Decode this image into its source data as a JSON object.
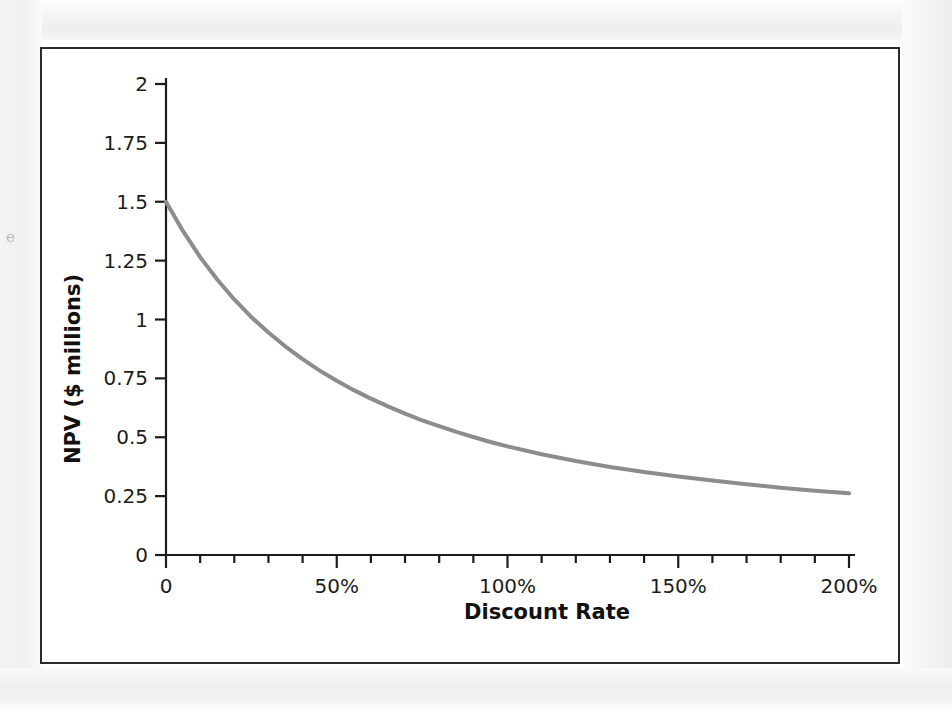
{
  "figure": {
    "margin_fragment": "e",
    "frame_color": "#2b2b2b",
    "background": "#ffffff"
  },
  "chart_data": {
    "type": "line",
    "title": "",
    "subtitle": "",
    "xlabel": "Discount Rate",
    "ylabel": "NPV ($ millions)",
    "xlim": [
      0,
      200
    ],
    "ylim": [
      0,
      2
    ],
    "grid": false,
    "legend": null,
    "legend_position": "none",
    "line_color": "#8c8c8c",
    "line_width": 4,
    "x_tick_labels": [
      "0",
      "50%",
      "100%",
      "150%",
      "200%"
    ],
    "x_tick_values": [
      0,
      50,
      100,
      150,
      200
    ],
    "x_minor_tick_step": 10,
    "y_tick_labels": [
      "0",
      "0.25",
      "0.5",
      "0.75",
      "1",
      "1.25",
      "1.5",
      "1.75",
      "2"
    ],
    "y_tick_values": [
      0,
      0.25,
      0.5,
      0.75,
      1,
      1.25,
      1.5,
      1.75,
      2
    ],
    "series": [
      {
        "name": "NPV",
        "x": [
          0,
          5,
          10,
          15,
          20,
          25,
          30,
          35,
          40,
          45,
          50,
          55,
          60,
          65,
          70,
          75,
          80,
          85,
          90,
          95,
          100,
          110,
          120,
          130,
          140,
          150,
          160,
          170,
          180,
          190,
          200
        ],
        "values": [
          1.5,
          1.375,
          1.265,
          1.17,
          1.085,
          1.01,
          0.945,
          0.885,
          0.832,
          0.783,
          0.74,
          0.7,
          0.664,
          0.631,
          0.6,
          0.572,
          0.547,
          0.523,
          0.501,
          0.48,
          0.461,
          0.428,
          0.399,
          0.374,
          0.352,
          0.333,
          0.316,
          0.3,
          0.286,
          0.273,
          0.262
        ]
      }
    ],
    "annotations": []
  }
}
